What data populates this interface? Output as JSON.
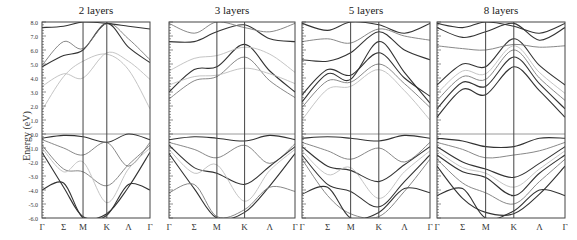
{
  "figure": {
    "ylabel": "Energy (eV)",
    "yticks": [
      "8.0",
      "7.0",
      "6.0",
      "5.0",
      "4.0",
      "3.0",
      "2.0",
      "1.0",
      "0.0",
      "-1.0",
      "-2.0",
      "-3.0",
      "-4.0",
      "-5.0",
      "-6.0"
    ],
    "ylim": [
      -6.0,
      8.0
    ],
    "xticks": [
      "Γ",
      "Σ",
      "M",
      "K",
      "Λ",
      "Γ"
    ],
    "fermi_level": 0.0,
    "colors": {
      "dark": "#333333",
      "mid": "#7a7a7a",
      "light": "#bdbdbd",
      "fermi": "#9a9a9a",
      "axis": "#444444"
    }
  },
  "chart_data": [
    {
      "type": "line",
      "title": "2 layers",
      "xlabel": "",
      "ylabel": "Energy (eV)",
      "x": [
        "Γ",
        "Σ",
        "M",
        "K",
        "Λ",
        "Γ"
      ],
      "ylim": [
        -6,
        8
      ],
      "series": [
        {
          "name": "cb1",
          "shade": "dark",
          "values": [
            4.8,
            5.6,
            6.0,
            7.9,
            6.2,
            5.1
          ]
        },
        {
          "name": "cb2",
          "shade": "mid",
          "values": [
            4.9,
            6.6,
            6.1,
            7.9,
            6.8,
            5.3
          ]
        },
        {
          "name": "cb3",
          "shade": "light",
          "values": [
            3.4,
            4.3,
            4.0,
            5.8,
            5.2,
            3.9
          ]
        },
        {
          "name": "cb4",
          "shade": "light",
          "values": [
            1.7,
            4.1,
            5.2,
            5.7,
            4.6,
            1.8
          ]
        },
        {
          "name": "cb5",
          "shade": "dark",
          "values": [
            7.6,
            7.7,
            8.0,
            7.9,
            7.7,
            7.5
          ]
        },
        {
          "name": "vb1",
          "shade": "dark",
          "values": [
            -0.3,
            -0.1,
            -0.2,
            -0.6,
            0.0,
            -0.4
          ]
        },
        {
          "name": "vb2",
          "shade": "mid",
          "values": [
            -0.4,
            -1.0,
            -1.5,
            -0.6,
            -2.3,
            -0.6
          ]
        },
        {
          "name": "vb3",
          "shade": "mid",
          "values": [
            -0.8,
            -2.5,
            -2.7,
            -3.7,
            -2.2,
            -0.8
          ]
        },
        {
          "name": "vb4",
          "shade": "light",
          "values": [
            -1.0,
            -2.7,
            -2.0,
            -4.9,
            -2.5,
            -1.0
          ]
        },
        {
          "name": "vb5",
          "shade": "dark",
          "values": [
            -4.0,
            -3.5,
            -6.0,
            -5.8,
            -3.6,
            -4.0
          ]
        },
        {
          "name": "vb6",
          "shade": "dark",
          "values": [
            -1.3,
            -3.8,
            -5.9,
            -5.7,
            -3.8,
            -1.3
          ]
        }
      ]
    },
    {
      "type": "line",
      "title": "3 layers",
      "xlabel": "",
      "ylabel": "",
      "x": [
        "Γ",
        "Σ",
        "M",
        "K",
        "Λ",
        "Γ"
      ],
      "ylim": [
        -6,
        8
      ],
      "series": [
        {
          "name": "cb1",
          "shade": "dark",
          "values": [
            3.0,
            4.6,
            4.8,
            6.4,
            4.5,
            3.0
          ]
        },
        {
          "name": "cb2",
          "shade": "mid",
          "values": [
            2.5,
            3.8,
            4.1,
            5.5,
            3.8,
            2.6
          ]
        },
        {
          "name": "cb3",
          "shade": "light",
          "values": [
            3.5,
            4.1,
            4.2,
            4.7,
            4.3,
            3.6
          ]
        },
        {
          "name": "cb4",
          "shade": "light",
          "values": [
            4.5,
            5.4,
            5.6,
            6.2,
            5.7,
            4.4
          ]
        },
        {
          "name": "cb5",
          "shade": "dark",
          "values": [
            6.6,
            6.6,
            7.3,
            7.8,
            6.8,
            6.6
          ]
        },
        {
          "name": "cb6",
          "shade": "mid",
          "values": [
            7.9,
            7.2,
            8.0,
            7.6,
            7.3,
            7.9
          ]
        },
        {
          "name": "vb1",
          "shade": "dark",
          "values": [
            -0.4,
            -0.2,
            -0.3,
            -0.5,
            -0.1,
            -0.4
          ]
        },
        {
          "name": "vb2",
          "shade": "mid",
          "values": [
            -0.6,
            -1.1,
            -1.7,
            -0.8,
            -2.1,
            -0.7
          ]
        },
        {
          "name": "vb3",
          "shade": "dark",
          "values": [
            -0.8,
            -2.4,
            -2.8,
            -3.6,
            -2.3,
            -0.9
          ]
        },
        {
          "name": "vb4",
          "shade": "light",
          "values": [
            -1.1,
            -2.8,
            -2.2,
            -4.8,
            -2.6,
            -1.1
          ]
        },
        {
          "name": "vb5",
          "shade": "dark",
          "values": [
            -1.4,
            -3.9,
            -6.0,
            -5.6,
            -3.7,
            -1.4
          ]
        },
        {
          "name": "vb6",
          "shade": "mid",
          "values": [
            -4.2,
            -3.6,
            -5.9,
            -5.4,
            -3.8,
            -4.1
          ]
        }
      ]
    },
    {
      "type": "line",
      "title": "5 layers",
      "xlabel": "",
      "ylabel": "",
      "x": [
        "Γ",
        "Σ",
        "M",
        "K",
        "Λ",
        "Γ"
      ],
      "ylim": [
        -6,
        8
      ],
      "series": [
        {
          "name": "cb1",
          "shade": "dark",
          "values": [
            2.3,
            4.3,
            3.9,
            6.6,
            4.4,
            2.2
          ]
        },
        {
          "name": "cb2",
          "shade": "dark",
          "values": [
            2.8,
            4.6,
            4.2,
            5.8,
            4.0,
            2.7
          ]
        },
        {
          "name": "cb3",
          "shade": "mid",
          "values": [
            1.9,
            3.8,
            3.7,
            5.0,
            3.6,
            1.9
          ]
        },
        {
          "name": "cb4",
          "shade": "light",
          "values": [
            1.0,
            3.2,
            3.4,
            4.6,
            3.1,
            1.0
          ]
        },
        {
          "name": "cb5",
          "shade": "dark",
          "values": [
            5.3,
            5.2,
            5.8,
            7.3,
            6.0,
            5.3
          ]
        },
        {
          "name": "cb6",
          "shade": "mid",
          "values": [
            6.6,
            6.8,
            6.5,
            7.5,
            7.0,
            6.7
          ]
        },
        {
          "name": "cb7",
          "shade": "dark",
          "values": [
            7.9,
            7.4,
            8.0,
            7.8,
            7.2,
            7.9
          ]
        },
        {
          "name": "vb1",
          "shade": "dark",
          "values": [
            -0.3,
            -0.2,
            -0.3,
            -0.5,
            -0.1,
            -0.3
          ]
        },
        {
          "name": "vb2",
          "shade": "mid",
          "values": [
            -0.6,
            -1.2,
            -1.8,
            -1.0,
            -2.0,
            -0.6
          ]
        },
        {
          "name": "vb3",
          "shade": "dark",
          "values": [
            -0.9,
            -2.3,
            -2.6,
            -3.4,
            -2.2,
            -0.9
          ]
        },
        {
          "name": "vb4",
          "shade": "light",
          "values": [
            -1.2,
            -2.9,
            -2.4,
            -4.6,
            -2.7,
            -1.2
          ]
        },
        {
          "name": "vb5",
          "shade": "dark",
          "values": [
            -1.5,
            -3.6,
            -4.1,
            -5.2,
            -3.4,
            -1.5
          ]
        },
        {
          "name": "vb6",
          "shade": "mid",
          "values": [
            -1.8,
            -4.4,
            -5.7,
            -5.9,
            -4.1,
            -1.8
          ]
        },
        {
          "name": "vb7",
          "shade": "dark",
          "values": [
            -4.3,
            -3.8,
            -6.0,
            -5.6,
            -3.9,
            -4.2
          ]
        }
      ]
    },
    {
      "type": "line",
      "title": "8 layers",
      "xlabel": "",
      "ylabel": "",
      "x": [
        "Γ",
        "Σ",
        "M",
        "K",
        "Λ",
        "Γ"
      ],
      "ylim": [
        -6,
        8
      ],
      "series": [
        {
          "name": "cb1",
          "shade": "dark",
          "values": [
            1.2,
            3.2,
            2.8,
            4.8,
            3.1,
            1.2
          ]
        },
        {
          "name": "cb2",
          "shade": "dark",
          "values": [
            1.8,
            3.7,
            3.4,
            5.5,
            3.6,
            1.8
          ]
        },
        {
          "name": "cb3",
          "shade": "mid",
          "values": [
            2.4,
            4.1,
            3.9,
            6.0,
            4.0,
            2.4
          ]
        },
        {
          "name": "cb4",
          "shade": "light",
          "values": [
            2.9,
            4.5,
            4.3,
            6.3,
            4.4,
            2.9
          ]
        },
        {
          "name": "cb5",
          "shade": "dark",
          "values": [
            3.5,
            5.0,
            4.8,
            6.8,
            4.9,
            3.5
          ]
        },
        {
          "name": "cb6",
          "shade": "mid",
          "values": [
            6.3,
            6.1,
            6.0,
            6.4,
            6.2,
            6.3
          ]
        },
        {
          "name": "cb7",
          "shade": "dark",
          "values": [
            7.6,
            6.9,
            7.3,
            7.9,
            6.7,
            7.6
          ]
        },
        {
          "name": "cb8",
          "shade": "dark",
          "values": [
            7.9,
            7.6,
            8.0,
            7.7,
            7.2,
            7.9
          ]
        },
        {
          "name": "vb1",
          "shade": "dark",
          "values": [
            -0.3,
            -0.5,
            -0.9,
            -0.9,
            -0.3,
            -0.3
          ]
        },
        {
          "name": "vb2",
          "shade": "mid",
          "values": [
            -0.6,
            -1.1,
            -1.7,
            -1.5,
            -1.2,
            -0.6
          ]
        },
        {
          "name": "vb3",
          "shade": "dark",
          "values": [
            -0.9,
            -2.0,
            -2.5,
            -3.1,
            -2.1,
            -0.9
          ]
        },
        {
          "name": "vb4",
          "shade": "light",
          "values": [
            -1.2,
            -2.4,
            -2.8,
            -3.8,
            -2.5,
            -1.2
          ]
        },
        {
          "name": "vb5",
          "shade": "dark",
          "values": [
            -1.5,
            -2.7,
            -3.1,
            -4.4,
            -2.8,
            -1.5
          ]
        },
        {
          "name": "vb6",
          "shade": "mid",
          "values": [
            -1.8,
            -3.5,
            -4.2,
            -5.0,
            -3.4,
            -1.8
          ]
        },
        {
          "name": "vb7",
          "shade": "dark",
          "values": [
            -2.3,
            -4.6,
            -5.6,
            -5.7,
            -4.3,
            -2.3
          ]
        },
        {
          "name": "vb8",
          "shade": "dark",
          "values": [
            -4.4,
            -3.9,
            -6.0,
            -5.5,
            -4.0,
            -4.4
          ]
        }
      ]
    }
  ]
}
